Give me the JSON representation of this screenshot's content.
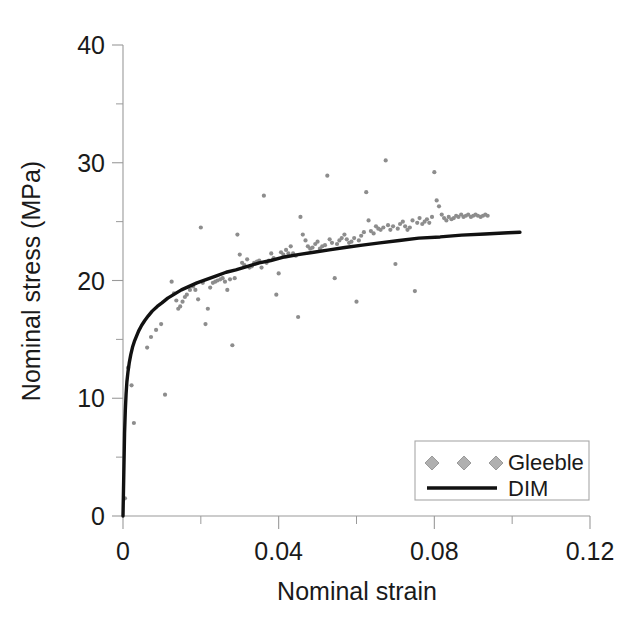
{
  "chart_data": {
    "type": "scatter",
    "title": "",
    "xlabel": "Nominal strain",
    "ylabel": "Nominal stress (MPa)",
    "xlim": [
      0,
      0.12
    ],
    "ylim": [
      0,
      40
    ],
    "xticks": [
      0,
      0.04,
      0.08,
      0.12
    ],
    "xtick_labels": [
      "0",
      "0.04",
      "0.08",
      "0.12"
    ],
    "xminor_step": 0.02,
    "yticks": [
      0,
      10,
      20,
      30,
      40
    ],
    "ytick_labels": [
      "0",
      "10",
      "20",
      "30",
      "40"
    ],
    "yminor_step": 5,
    "grid": false,
    "legend_position": "lower-right",
    "series": [
      {
        "name": "Gleeble",
        "type": "scatter",
        "marker": "diamond",
        "color": "#8d8d8d",
        "points": [
          [
            0.0005,
            1.5
          ],
          [
            0.0013,
            12.6
          ],
          [
            0.0022,
            11.1
          ],
          [
            0.0028,
            7.9
          ],
          [
            0.0062,
            14.3
          ],
          [
            0.0072,
            15.2
          ],
          [
            0.0085,
            15.8
          ],
          [
            0.0098,
            16.3
          ],
          [
            0.0108,
            10.3
          ],
          [
            0.0125,
            19.9
          ],
          [
            0.0131,
            18.9
          ],
          [
            0.0137,
            18.3
          ],
          [
            0.0142,
            17.6
          ],
          [
            0.0147,
            17.8
          ],
          [
            0.0153,
            18.2
          ],
          [
            0.0159,
            18.6
          ],
          [
            0.0164,
            18.8
          ],
          [
            0.0172,
            19.2
          ],
          [
            0.018,
            19.5
          ],
          [
            0.0186,
            19.2
          ],
          [
            0.0193,
            18.4
          ],
          [
            0.02,
            24.5
          ],
          [
            0.0205,
            19.8
          ],
          [
            0.0212,
            16.3
          ],
          [
            0.0218,
            17.6
          ],
          [
            0.0224,
            19.4
          ],
          [
            0.0231,
            19.8
          ],
          [
            0.0237,
            19.9
          ],
          [
            0.0243,
            20.0
          ],
          [
            0.025,
            20.1
          ],
          [
            0.0256,
            20.2
          ],
          [
            0.0262,
            19.9
          ],
          [
            0.0268,
            19.2
          ],
          [
            0.0275,
            20.1
          ],
          [
            0.0281,
            14.5
          ],
          [
            0.0287,
            20.2
          ],
          [
            0.0294,
            23.9
          ],
          [
            0.03,
            22.2
          ],
          [
            0.0306,
            21.5
          ],
          [
            0.0312,
            21.3
          ],
          [
            0.0319,
            21.8
          ],
          [
            0.0325,
            21.1
          ],
          [
            0.0331,
            21.2
          ],
          [
            0.0337,
            21.5
          ],
          [
            0.0344,
            21.6
          ],
          [
            0.035,
            21.7
          ],
          [
            0.0356,
            21.1
          ],
          [
            0.0362,
            27.2
          ],
          [
            0.0369,
            21.5
          ],
          [
            0.0375,
            21.7
          ],
          [
            0.0381,
            22.3
          ],
          [
            0.0387,
            21.9
          ],
          [
            0.0394,
            18.8
          ],
          [
            0.04,
            20.6
          ],
          [
            0.0406,
            22.4
          ],
          [
            0.0412,
            22.2
          ],
          [
            0.0419,
            22.6
          ],
          [
            0.0425,
            22.3
          ],
          [
            0.0431,
            22.9
          ],
          [
            0.0437,
            22.3
          ],
          [
            0.0444,
            22.1
          ],
          [
            0.045,
            16.9
          ],
          [
            0.0456,
            25.4
          ],
          [
            0.0462,
            23.9
          ],
          [
            0.0469,
            23.4
          ],
          [
            0.0475,
            22.9
          ],
          [
            0.0481,
            22.7
          ],
          [
            0.0487,
            22.8
          ],
          [
            0.0494,
            23.1
          ],
          [
            0.05,
            23.3
          ],
          [
            0.0506,
            22.7
          ],
          [
            0.0512,
            22.9
          ],
          [
            0.0519,
            23.0
          ],
          [
            0.0525,
            28.9
          ],
          [
            0.0531,
            23.5
          ],
          [
            0.0537,
            23.2
          ],
          [
            0.0544,
            20.2
          ],
          [
            0.055,
            23.1
          ],
          [
            0.0556,
            23.4
          ],
          [
            0.0562,
            23.6
          ],
          [
            0.0569,
            23.9
          ],
          [
            0.0575,
            23.5
          ],
          [
            0.0581,
            23.2
          ],
          [
            0.0587,
            23.3
          ],
          [
            0.0594,
            23.6
          ],
          [
            0.06,
            18.2
          ],
          [
            0.0606,
            23.4
          ],
          [
            0.0612,
            23.8
          ],
          [
            0.0619,
            24.1
          ],
          [
            0.0625,
            27.5
          ],
          [
            0.0631,
            25.1
          ],
          [
            0.0637,
            24.2
          ],
          [
            0.0644,
            24.0
          ],
          [
            0.065,
            24.6
          ],
          [
            0.0656,
            24.4
          ],
          [
            0.0662,
            24.3
          ],
          [
            0.0669,
            24.5
          ],
          [
            0.0675,
            30.2
          ],
          [
            0.0681,
            24.7
          ],
          [
            0.0687,
            24.3
          ],
          [
            0.0694,
            24.6
          ],
          [
            0.07,
            21.4
          ],
          [
            0.0706,
            24.4
          ],
          [
            0.0712,
            24.8
          ],
          [
            0.0719,
            25.0
          ],
          [
            0.0725,
            24.6
          ],
          [
            0.0731,
            24.3
          ],
          [
            0.0737,
            24.5
          ],
          [
            0.0744,
            25.1
          ],
          [
            0.075,
            19.1
          ],
          [
            0.0756,
            24.9
          ],
          [
            0.0762,
            25.3
          ],
          [
            0.0769,
            24.8
          ],
          [
            0.0775,
            25.0
          ],
          [
            0.0781,
            25.2
          ],
          [
            0.0787,
            24.9
          ],
          [
            0.0794,
            25.4
          ],
          [
            0.08,
            29.2
          ],
          [
            0.0806,
            26.8
          ],
          [
            0.0812,
            26.3
          ],
          [
            0.0819,
            25.6
          ],
          [
            0.0825,
            25.3
          ],
          [
            0.0831,
            25.1
          ],
          [
            0.0837,
            25.4
          ],
          [
            0.0844,
            25.2
          ],
          [
            0.085,
            25.3
          ],
          [
            0.0856,
            25.5
          ],
          [
            0.0862,
            25.4
          ],
          [
            0.0869,
            25.6
          ],
          [
            0.0875,
            25.4
          ],
          [
            0.0881,
            25.5
          ],
          [
            0.0887,
            25.6
          ],
          [
            0.0894,
            25.4
          ],
          [
            0.09,
            25.5
          ],
          [
            0.0906,
            25.6
          ],
          [
            0.0912,
            25.5
          ],
          [
            0.0919,
            25.4
          ],
          [
            0.0925,
            25.5
          ],
          [
            0.0931,
            25.6
          ],
          [
            0.0937,
            25.5
          ]
        ]
      },
      {
        "name": "DIM",
        "type": "line",
        "color": "#111111",
        "points": [
          [
            0.0,
            0.0
          ],
          [
            0.0002,
            3.5
          ],
          [
            0.0004,
            7.0
          ],
          [
            0.0006,
            9.0
          ],
          [
            0.0008,
            10.4
          ],
          [
            0.001,
            11.4
          ],
          [
            0.0013,
            12.3
          ],
          [
            0.0016,
            13.0
          ],
          [
            0.002,
            13.7
          ],
          [
            0.0025,
            14.4
          ],
          [
            0.003,
            14.9
          ],
          [
            0.0035,
            15.3
          ],
          [
            0.004,
            15.7
          ],
          [
            0.0048,
            16.2
          ],
          [
            0.0056,
            16.6
          ],
          [
            0.0065,
            17.0
          ],
          [
            0.0075,
            17.4
          ],
          [
            0.0088,
            17.8
          ],
          [
            0.01,
            18.1
          ],
          [
            0.0115,
            18.5
          ],
          [
            0.013,
            18.8
          ],
          [
            0.015,
            19.2
          ],
          [
            0.017,
            19.5
          ],
          [
            0.019,
            19.8
          ],
          [
            0.0215,
            20.1
          ],
          [
            0.024,
            20.4
          ],
          [
            0.0265,
            20.7
          ],
          [
            0.029,
            20.9
          ],
          [
            0.032,
            21.2
          ],
          [
            0.035,
            21.5
          ],
          [
            0.038,
            21.7
          ],
          [
            0.0415,
            22.0
          ],
          [
            0.045,
            22.2
          ],
          [
            0.049,
            22.4
          ],
          [
            0.053,
            22.6
          ],
          [
            0.057,
            22.8
          ],
          [
            0.0615,
            23.0
          ],
          [
            0.066,
            23.2
          ],
          [
            0.071,
            23.4
          ],
          [
            0.076,
            23.6
          ],
          [
            0.0815,
            23.7
          ],
          [
            0.087,
            23.85
          ],
          [
            0.093,
            23.95
          ],
          [
            0.099,
            24.05
          ],
          [
            0.102,
            24.1
          ]
        ]
      }
    ],
    "legend": {
      "entries": [
        {
          "label": "Gleeble",
          "style": "diamond-markers"
        },
        {
          "label": "DIM",
          "style": "solid-line"
        }
      ]
    }
  }
}
